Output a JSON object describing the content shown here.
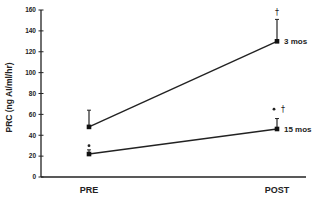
{
  "chart_data": {
    "type": "line",
    "title": "",
    "xlabel": "",
    "ylabel": "PRC (ng AI/ml/hr)",
    "categories": [
      "PRE",
      "POST"
    ],
    "ylim": [
      0,
      160
    ],
    "yticks": [
      0,
      20,
      40,
      60,
      80,
      100,
      120,
      140,
      160
    ],
    "grid": false,
    "legend_position": "inline-right",
    "series": [
      {
        "name": "3 mos",
        "values": [
          48,
          130
        ],
        "error_upper": [
          64,
          151
        ]
      },
      {
        "name": "15 mos",
        "values": [
          22,
          46
        ],
        "error_upper": [
          26,
          56
        ]
      }
    ],
    "annotations": [
      {
        "text": "•",
        "at": "PRE",
        "between_series": true,
        "y": 30
      },
      {
        "text": "†",
        "at": "POST",
        "series": "3 mos",
        "y": 157
      },
      {
        "text": "• †",
        "at": "POST",
        "series": "15 mos",
        "y": 65
      }
    ]
  }
}
